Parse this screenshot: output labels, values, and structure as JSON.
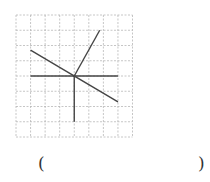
{
  "figure": {
    "grid": {
      "columns": 8,
      "rows": 8,
      "line_style": "dashed",
      "line_color": "#b8b8b8"
    },
    "line_color": "#454545",
    "center": [
      4,
      4
    ],
    "segments": [
      {
        "name": "horizontal-line",
        "from": [
          1,
          4
        ],
        "to": [
          7,
          4
        ]
      },
      {
        "name": "vertical-ray-down",
        "from": [
          4,
          4
        ],
        "to": [
          4,
          7
        ]
      },
      {
        "name": "diagonal-line",
        "from": [
          1,
          2.3
        ],
        "to": [
          7,
          5.7
        ]
      },
      {
        "name": "ray-up-right",
        "from": [
          4,
          4
        ],
        "to": [
          5.75,
          1
        ]
      }
    ]
  },
  "answer_blank": {
    "open": "(",
    "close": ")",
    "value": ""
  }
}
